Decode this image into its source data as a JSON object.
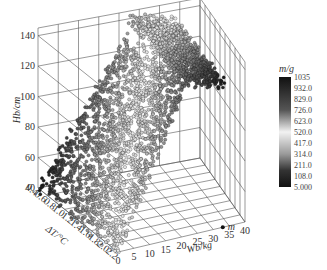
{
  "chart_data": {
    "type": "scatter3d",
    "title": "",
    "xlabel": "Wb/kg",
    "ylabel": "ΔT/°C",
    "zlabel": "Hb/cm",
    "colorbar_label": "m/g",
    "x_ticks": [
      "0",
      "5",
      "10",
      "15",
      "20",
      "25",
      "30",
      "35",
      "40"
    ],
    "y_ticks": [
      "0.4",
      "0.6",
      "0.8",
      "1.0",
      "1.2",
      "1.4",
      "1.6",
      "1.8",
      "2.0",
      "2.2"
    ],
    "z_ticks": [
      "40",
      "60",
      "80",
      "100",
      "120",
      "140"
    ],
    "xlim": [
      0,
      40
    ],
    "ylim": [
      0.4,
      2.2
    ],
    "zlim": [
      40,
      145
    ],
    "colorbar_ticks": [
      "1035",
      "932.0",
      "829.0",
      "726.0",
      "623.0",
      "520.0",
      "417.0",
      "314.0",
      "211.0",
      "108.0",
      "5.000"
    ],
    "colorbar_range": [
      5,
      1035
    ],
    "colormap": "grayscale: dark at extremes, light at middle (~520)",
    "annotation": {
      "text": "m",
      "x": 33,
      "y": 2.2,
      "z": 40
    },
    "grid": true,
    "legend_position": "right"
  }
}
